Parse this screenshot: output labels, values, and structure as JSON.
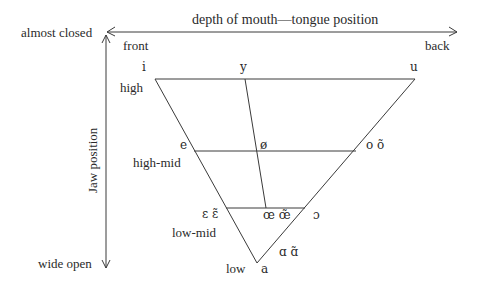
{
  "axes": {
    "horizontal": {
      "label": "depth of mouth—tongue position",
      "left_end": "front",
      "right_end": "back"
    },
    "vertical": {
      "label": "Jaw position",
      "top_end": "almost closed",
      "bottom_end": "wide open"
    }
  },
  "heights": {
    "high": "high",
    "high_mid": "high-mid",
    "low_mid": "low-mid",
    "low": "low"
  },
  "vowels": {
    "i": "i",
    "y": "y",
    "u": "u",
    "e": "e",
    "o_slash": "ø",
    "o": "o õ",
    "epsilon": "ɛ ɛ̃",
    "oe": "œ œ̃",
    "open_o": "ɔ",
    "alpha": "ɑ ɑ̃",
    "a": "a"
  },
  "colors": {
    "line": "#3a3a3a",
    "text": "#2a2a2a",
    "background": "#ffffff"
  }
}
